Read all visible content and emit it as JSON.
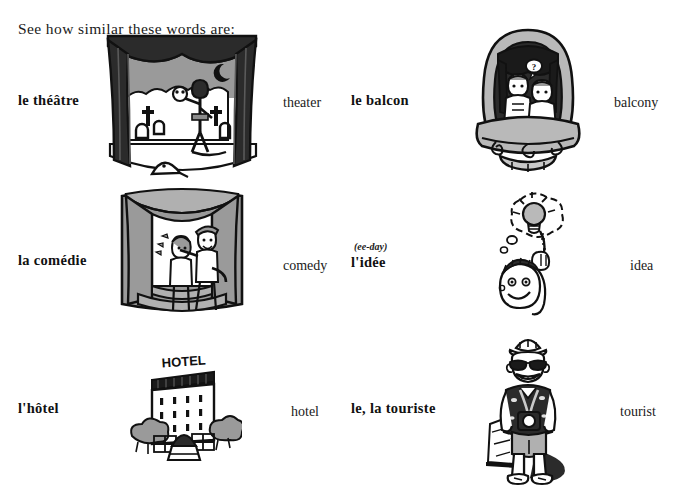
{
  "heading": "See how similar these words are:",
  "entries": [
    {
      "french": "le théâtre",
      "english": "theater",
      "pronunciation": "",
      "illustration": "theater-stage-illustration",
      "column": "left",
      "row": 1
    },
    {
      "french": "le balcon",
      "english": "balcony",
      "pronunciation": "",
      "illustration": "opera-balcony-illustration",
      "column": "right",
      "row": 1
    },
    {
      "french": "la comédie",
      "english": "comedy",
      "pronunciation": "",
      "illustration": "comedy-stage-illustration",
      "column": "left",
      "row": 2
    },
    {
      "french": "l'idée",
      "english": "idea",
      "pronunciation": "(ee-day)",
      "illustration": "lightbulb-idea-illustration",
      "column": "right",
      "row": 2
    },
    {
      "french": "l'hôtel",
      "english": "hotel",
      "pronunciation": "",
      "illustration": "hotel-building-illustration",
      "column": "left",
      "row": 3
    },
    {
      "french": "le, la touriste",
      "english": "tourist",
      "pronunciation": "",
      "illustration": "tourist-person-illustration",
      "column": "right",
      "row": 3
    }
  ],
  "illustration_text": {
    "hotel_sign": "HOTEL"
  },
  "colors": {
    "ink": "#111111",
    "dark_fill": "#2b2b2b",
    "mid_gray": "#8c8c8c",
    "light_gray": "#c9c9c9",
    "paper": "#ffffff"
  }
}
